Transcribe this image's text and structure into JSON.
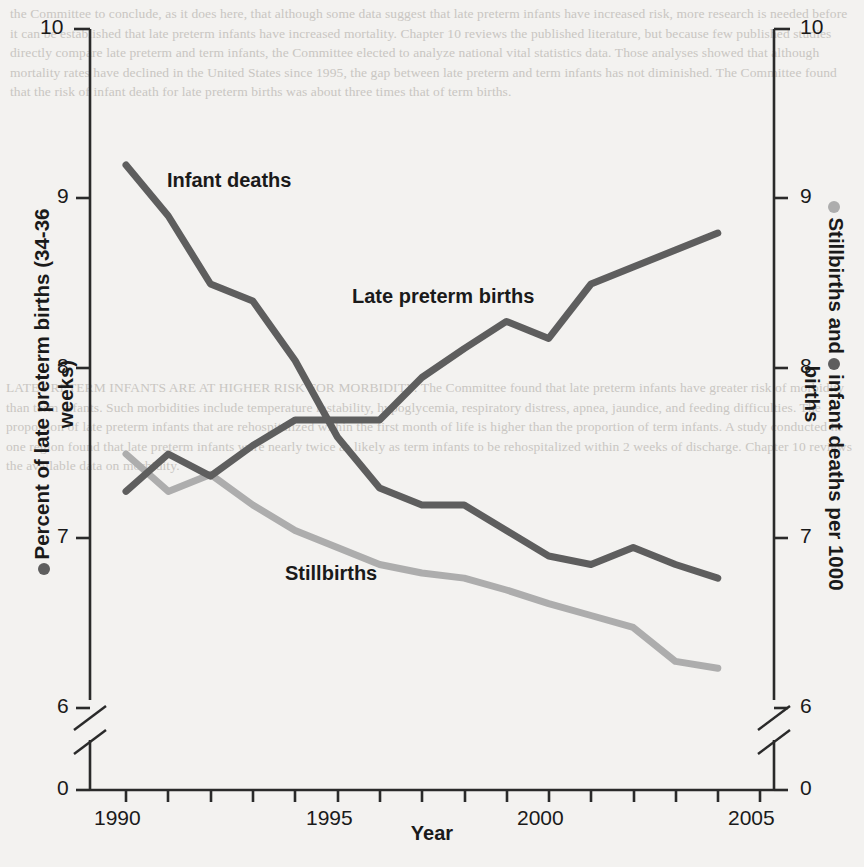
{
  "figure": {
    "xlabel": "Year",
    "ylabel_left": "Percent of late preterm births (34-36 weeks)",
    "ylabel_right_part1": "Stillbirths and",
    "ylabel_right_part2": "infant deaths per 1000 births",
    "annotation_infant": "Infant deaths",
    "annotation_latepreterm": "Late preterm births",
    "annotation_stillbirths": "Stillbirths",
    "colors": {
      "dark_series": "#5e5e5e",
      "light_series": "#adadad",
      "axis": "#2a2a2a",
      "background": "#f3f2f0",
      "text": "#1a1a1a"
    }
  },
  "background_text": {
    "top": "the Committee to conclude, as it does here, that although some data suggest that late preterm infants have increased risk, more research is needed before it can be established that late preterm infants have increased mortality. Chapter 10 reviews the published literature, but because few published studies directly compare late preterm and term infants, the Committee elected to analyze national vital statistics data. Those analyses showed that although mortality rates have declined in the United States since 1995, the gap between late preterm and term infants has not diminished. The Committee found that the risk of infant death for late preterm births was about three times that of term births.",
    "mid": "LATE PRETERM INFANTS ARE AT HIGHER RISK FOR MORBIDITY. The Committee found that late preterm infants have greater risk of morbidity than term infants. Such morbidities include temperature instability, hypoglycemia, respiratory distress, apnea, jaundice, and feeding difficulties. The proportion of late preterm infants that are rehospitalized within the first month of life is higher than the proportion of term infants. A study conducted in one region found that late preterm infants were nearly twice as likely as term infants to be rehospitalized within 2 weeks of discharge. Chapter 10 reviews the available data on morbidity."
  },
  "chart_data": {
    "type": "line",
    "title": "",
    "xlabel": "Year",
    "ylabel": "Percent of late preterm births (34-36 weeks)",
    "ylabel_secondary": "Stillbirths and infant deaths per 1000 births",
    "x": [
      1990,
      1991,
      1992,
      1993,
      1994,
      1995,
      1996,
      1997,
      1998,
      1999,
      2000,
      2001,
      2002,
      2003,
      2004
    ],
    "xlim": [
      1989.2,
      2005.5
    ],
    "xticks": [
      1990,
      1991,
      1992,
      1993,
      1994,
      1995,
      1996,
      1997,
      1998,
      1999,
      2000,
      2001,
      2002,
      2003,
      2004,
      2005
    ],
    "xticklabels_shown": [
      "1990",
      "1995",
      "2000",
      "2005"
    ],
    "ylim": [
      6.0,
      10.0
    ],
    "yticks": [
      6,
      7,
      8,
      9,
      10
    ],
    "yticklabels": [
      "6",
      "7",
      "8",
      "9",
      "10"
    ],
    "y_axis_break": true,
    "y_axis_zero_label": "0",
    "grid": false,
    "legend": "inline-annotations",
    "series": [
      {
        "name": "Infant deaths",
        "color": "#5e5e5e",
        "axis": "right",
        "unit": "per 1000 births",
        "values": [
          9.2,
          8.9,
          8.5,
          8.4,
          8.05,
          7.6,
          7.3,
          7.2,
          7.2,
          7.05,
          6.9,
          6.85,
          6.95,
          6.85,
          6.77
        ]
      },
      {
        "name": "Late preterm births",
        "color": "#5e5e5e",
        "axis": "left",
        "unit": "percent",
        "values": [
          7.28,
          7.5,
          7.37,
          7.55,
          7.7,
          7.7,
          7.7,
          7.95,
          8.12,
          8.28,
          8.18,
          8.5,
          8.6,
          8.7,
          8.8
        ]
      },
      {
        "name": "Stillbirths",
        "color": "#adadad",
        "axis": "right",
        "unit": "per 1000 births",
        "values": [
          7.5,
          7.28,
          7.38,
          7.2,
          7.05,
          6.95,
          6.85,
          6.8,
          6.77,
          6.7,
          6.62,
          6.55,
          6.48,
          6.28,
          6.24
        ]
      }
    ]
  }
}
